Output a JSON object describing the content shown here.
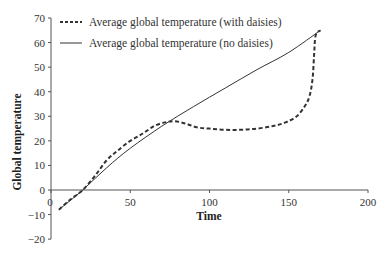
{
  "chart_data": {
    "type": "line",
    "title": "",
    "xlabel": "Time",
    "ylabel": "Global temperature",
    "xlim": [
      0,
      200
    ],
    "ylim": [
      -20,
      70
    ],
    "x_ticks": [
      0,
      50,
      100,
      150,
      200
    ],
    "y_ticks": [
      -20,
      -10,
      0,
      10,
      20,
      30,
      40,
      50,
      60,
      70
    ],
    "grid": false,
    "legend_position": "top-left",
    "series": [
      {
        "name": "Average global temperature (with daisies)",
        "style": "dashed",
        "x": [
          5,
          12,
          20,
          28,
          35,
          42,
          50,
          58,
          65,
          72,
          78,
          85,
          92,
          100,
          110,
          120,
          130,
          140,
          148,
          155,
          160,
          163,
          165,
          166,
          167,
          170
        ],
        "y": [
          -8,
          -4,
          0,
          6,
          12,
          16,
          20,
          23,
          26,
          27.5,
          28,
          27,
          25.5,
          25,
          24.5,
          24.5,
          25,
          26,
          27.5,
          30,
          34,
          38,
          45,
          55,
          63,
          65
        ]
      },
      {
        "name": "Average global temperature (no daisies)",
        "style": "solid",
        "x": [
          5,
          20,
          35,
          50,
          70,
          90,
          110,
          130,
          150,
          170
        ],
        "y": [
          -8,
          0,
          9,
          17,
          26,
          34,
          41.5,
          49,
          56,
          65
        ]
      }
    ]
  },
  "legend": [
    {
      "label": "Average global temperature (with daisies)",
      "style": "dashed"
    },
    {
      "label": "Average global temperature (no daisies)",
      "style": "solid"
    }
  ],
  "axes": {
    "xlabel": "Time",
    "ylabel": "Global temperature",
    "x_tick_labels": [
      "0",
      "50",
      "100",
      "150",
      "200"
    ],
    "y_tick_labels": [
      "70",
      "60",
      "50",
      "40",
      "30",
      "20",
      "10",
      "0",
      "−10",
      "−20"
    ]
  },
  "colors": {
    "line": "#333333",
    "axis": "#555555",
    "text": "#333333"
  }
}
